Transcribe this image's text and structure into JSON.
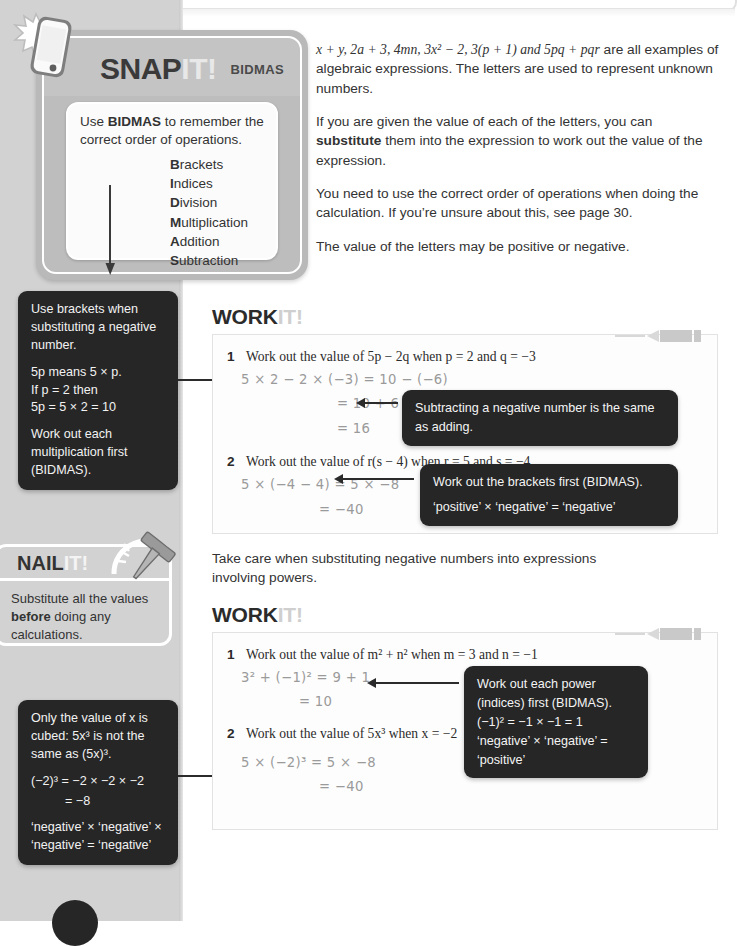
{
  "snapit": {
    "title_a": "SNAP",
    "title_b": "IT!",
    "topic": "BIDMAS",
    "icon": "smartphone-flash-icon",
    "lead_before": "Use ",
    "lead_bold": "BIDMAS",
    "lead_after": " to remember the correct order of operations.",
    "list": [
      {
        "cap": "B",
        "rest": "rackets"
      },
      {
        "cap": "I",
        "rest": "ndices"
      },
      {
        "cap": "D",
        "rest": "ivision"
      },
      {
        "cap": "M",
        "rest": "ultiplication"
      },
      {
        "cap": "A",
        "rest": "ddition"
      },
      {
        "cap": "S",
        "rest": "ubtraction"
      }
    ]
  },
  "body": {
    "p1_expr": "x + y, 2a + 3, 4mn, 3x² − 2, 3(p + 1) and 5pq + pqr",
    "p1_tail": " are all examples of algebraic expressions. The letters are used to represent unknown numbers.",
    "p2_a": "If you are given the value of each of the letters, you can ",
    "p2_bold": "substitute",
    "p2_b": " them into the expression to work out the value of the expression.",
    "p3": "You need to use the correct order of operations when doing the calculation. If you’re unsure about this, see page 30.",
    "p4": "The value of the letters may be positive or negative."
  },
  "note_brackets": {
    "l1": "Use brackets when substituting a negative number.",
    "l2": "5p means 5 × p.",
    "l3": "If p = 2 then",
    "l4": "5p = 5 × 2 = 10",
    "l5": "Work out each multiplication first (BIDMAS)."
  },
  "note_cubed": {
    "l1": "Only the value of x is cubed: 5x³ is not the same as (5x)³.",
    "l2": "(−2)³ = −2 × −2 × −2",
    "l3": "= −8",
    "l4": "‘negative’ × ‘negative’ × ‘negative’ = ‘negative’"
  },
  "nailit": {
    "title_a": "NAIL",
    "title_b": "IT!",
    "icon": "nail-icon",
    "body_a": "Substitute all the values ",
    "body_bold": "before",
    "body_b": " doing any calculations."
  },
  "workit1": {
    "title_a": "WORK",
    "title_b": "IT!",
    "q1_num": "1",
    "q1_text": "Work out the value of 5p − 2q when p = 2 and q = −3",
    "q1_w1": "5 × 2 − 2 × (−3) = 10 − (−6)",
    "q1_w2": "= 10 + 6",
    "q1_w3": "= 16",
    "q1_callout": "Subtracting a negative number is the same as adding.",
    "q2_num": "2",
    "q2_text": "Work out the value of r(s − 4) when r = 5 and s = −4",
    "q2_w1": "5 × (−4 − 4) = 5 × −8",
    "q2_w2": "= −40",
    "q2_callout_l1": "Work out the brackets first (BIDMAS).",
    "q2_callout_l2": "‘positive’ × ‘negative’ = ‘negative’"
  },
  "takecare": "Take care when substituting negative numbers into expressions involving powers.",
  "workit2": {
    "title_a": "WORK",
    "title_b": "IT!",
    "q1_num": "1",
    "q1_text": "Work out the value of m² + n² when m = 3 and n = −1",
    "q1_w1": "3² + (−1)² = 9 + 1",
    "q1_w2": "= 10",
    "q1_callout_l1": "Work out each power (indices) first (BIDMAS).",
    "q1_callout_l2": "(−1)² = −1 × −1 = 1",
    "q1_callout_l3": "‘negative’ × ‘negative’ = ‘positive’",
    "q2_num": "2",
    "q2_text": "Work out the value of 5x³ when x = −2",
    "q2_w1": "5 × (−2)³ = 5 × −8",
    "q2_w2": "= −40"
  },
  "colors": {
    "sidebar": "#d2d2d2",
    "note_bg": "#262626",
    "accent_light": "#cfcfcf",
    "work_ink": "#9a9a9a"
  }
}
